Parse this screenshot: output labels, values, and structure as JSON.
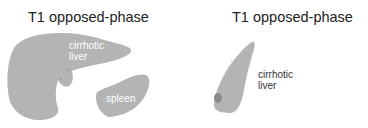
{
  "panels": [
    {
      "title": "T1 opposed-phase",
      "labels": {
        "liver": [
          "cirrhotic",
          "liver"
        ],
        "spleen": "spleen"
      }
    },
    {
      "title": "T1 opposed-phase",
      "labels": {
        "liver": [
          "cirrhotic",
          "liver"
        ]
      }
    }
  ],
  "colors": {
    "organ_fill": "#b4b4b4",
    "lesion_fill": "#8a8a8a",
    "inner_label": "#ffffff",
    "outer_label": "#333333",
    "title": "#222222"
  }
}
